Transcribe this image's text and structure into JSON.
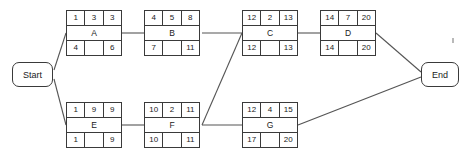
{
  "diagram": {
    "type": "activity-on-node-network",
    "title": "",
    "start_label": "Start",
    "end_label": "End",
    "cell_headers": [
      "early-start",
      "duration",
      "early-finish",
      "activity",
      "late-start",
      "slack",
      "late-finish"
    ],
    "nodes": [
      {
        "id": "A",
        "label": "A",
        "early_start": "1",
        "duration": "3",
        "early_finish": "3",
        "late_start": "4",
        "slack": "",
        "late_finish": "6",
        "x": 66,
        "y": 10
      },
      {
        "id": "B",
        "label": "B",
        "early_start": "4",
        "duration": "5",
        "early_finish": "8",
        "late_start": "7",
        "slack": "",
        "late_finish": "11",
        "x": 144,
        "y": 10
      },
      {
        "id": "C",
        "label": "C",
        "early_start": "12",
        "duration": "2",
        "early_finish": "13",
        "late_start": "12",
        "slack": "",
        "late_finish": "13",
        "x": 242,
        "y": 10
      },
      {
        "id": "D",
        "label": "D",
        "early_start": "14",
        "duration": "7",
        "early_finish": "20",
        "late_start": "14",
        "slack": "",
        "late_finish": "20",
        "x": 320,
        "y": 10
      },
      {
        "id": "E",
        "label": "E",
        "early_start": "1",
        "duration": "9",
        "early_finish": "9",
        "late_start": "1",
        "slack": "",
        "late_finish": "9",
        "x": 66,
        "y": 102
      },
      {
        "id": "F",
        "label": "F",
        "early_start": "10",
        "duration": "2",
        "early_finish": "11",
        "late_start": "10",
        "slack": "",
        "late_finish": "11",
        "x": 144,
        "y": 102
      },
      {
        "id": "G",
        "label": "G",
        "early_start": "12",
        "duration": "4",
        "early_finish": "15",
        "late_start": "17",
        "slack": "",
        "late_finish": "20",
        "x": 242,
        "y": 102
      }
    ],
    "edges": [
      {
        "from": "Start",
        "to": "A",
        "path": "M 54,70 L 66,33"
      },
      {
        "from": "Start",
        "to": "E",
        "path": "M 54,79 L 66,125"
      },
      {
        "from": "A",
        "to": "B",
        "path": "M 122,33 L 144,33"
      },
      {
        "from": "B",
        "to": "C",
        "path": "M 202,33 L 242,33"
      },
      {
        "from": "E",
        "to": "F",
        "path": "M 122,125 L 144,125"
      },
      {
        "from": "F",
        "to": "C",
        "path": "M 202,125 L 242,33"
      },
      {
        "from": "F",
        "to": "G",
        "path": "M 202,125 L 242,125"
      },
      {
        "from": "C",
        "to": "D",
        "path": "M 298,33 L 320,33"
      },
      {
        "from": "D",
        "to": "End",
        "path": "M 376,33 L 421,72"
      },
      {
        "from": "G",
        "to": "End",
        "path": "M 298,125 L 421,77"
      }
    ],
    "colors": {
      "stroke": "#3a3a3a",
      "edge": "#555555",
      "text": "#1a1a1a",
      "background": "#ffffff"
    }
  }
}
